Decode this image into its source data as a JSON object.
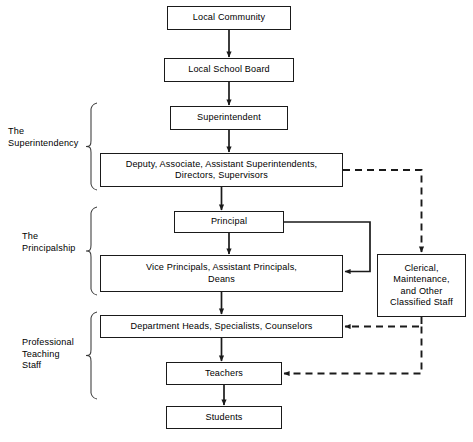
{
  "diagram": {
    "type": "flowchart",
    "background": "#ffffff",
    "line_color": "#1a1a1a",
    "box_border_color": "#1a1a1a",
    "box_fill": "#ffffff"
  },
  "nodes": [
    {
      "id": "local_community",
      "label": "Local Community",
      "x": 167,
      "y": 6,
      "w": 124,
      "h": 24
    },
    {
      "id": "local_school_board",
      "label": "Local School Board",
      "x": 164,
      "y": 58,
      "w": 130,
      "h": 24
    },
    {
      "id": "superintendent",
      "label": "Superintendent",
      "x": 170,
      "y": 106,
      "w": 118,
      "h": 24
    },
    {
      "id": "deputy_associate",
      "label": "Deputy, Associate, Assistant Superintendents,\nDirectors, Supervisors",
      "x": 100,
      "y": 153,
      "w": 243,
      "h": 34
    },
    {
      "id": "principal",
      "label": "Principal",
      "x": 174,
      "y": 211,
      "w": 110,
      "h": 22
    },
    {
      "id": "vice_principals",
      "label": "Vice Principals, Assistant Principals,\nDeans",
      "x": 100,
      "y": 255,
      "w": 243,
      "h": 37
    },
    {
      "id": "clerical_staff",
      "label": "Clerical,\nMaintenance,\nand Other\nClassified Staff",
      "x": 377,
      "y": 254,
      "w": 89,
      "h": 63
    },
    {
      "id": "department_heads",
      "label": "Department Heads, Specialists, Counselors",
      "x": 100,
      "y": 315,
      "w": 243,
      "h": 23
    },
    {
      "id": "teachers",
      "label": "Teachers",
      "x": 166,
      "y": 362,
      "w": 116,
      "h": 23
    },
    {
      "id": "students",
      "label": "Students",
      "x": 166,
      "y": 406,
      "w": 116,
      "h": 23
    }
  ],
  "group_labels": [
    {
      "id": "the_superintendency",
      "label": "The\nSuperintendency",
      "x": 8,
      "y": 126,
      "brace_top": 103,
      "brace_bottom": 190
    },
    {
      "id": "the_principalship",
      "label": "The\nPrincipalship",
      "x": 22,
      "y": 231,
      "brace_top": 207,
      "brace_bottom": 295
    },
    {
      "id": "professional_teaching",
      "label": "Professional\nTeaching\nStaff",
      "x": 22,
      "y": 337,
      "brace_top": 312,
      "brace_bottom": 399
    }
  ],
  "connectors": [
    {
      "from": "local_community",
      "to": "local_school_board",
      "style": "solid",
      "direction": "down"
    },
    {
      "from": "local_school_board",
      "to": "superintendent",
      "style": "solid",
      "direction": "down"
    },
    {
      "from": "superintendent",
      "to": "deputy_associate",
      "style": "solid",
      "direction": "down"
    },
    {
      "from": "deputy_associate",
      "to": "principal",
      "style": "solid",
      "direction": "down"
    },
    {
      "from": "principal",
      "to": "vice_principals",
      "style": "solid",
      "direction": "down"
    },
    {
      "from": "vice_principals",
      "to": "department_heads",
      "style": "solid",
      "direction": "down"
    },
    {
      "from": "department_heads",
      "to": "teachers",
      "style": "solid",
      "direction": "down"
    },
    {
      "from": "teachers",
      "to": "students",
      "style": "solid",
      "direction": "down"
    },
    {
      "from": "principal",
      "to": "vice_principals",
      "style": "solid",
      "direction": "right-down-left",
      "note": "routes right around clerical box"
    },
    {
      "from": "deputy_associate",
      "to": "clerical_staff",
      "style": "dashed",
      "direction": "right-down"
    },
    {
      "from": "clerical_staff",
      "to": "department_heads",
      "style": "dashed",
      "direction": "down-left"
    },
    {
      "from": "clerical_staff",
      "to": "teachers",
      "style": "dashed",
      "direction": "down-left"
    }
  ]
}
